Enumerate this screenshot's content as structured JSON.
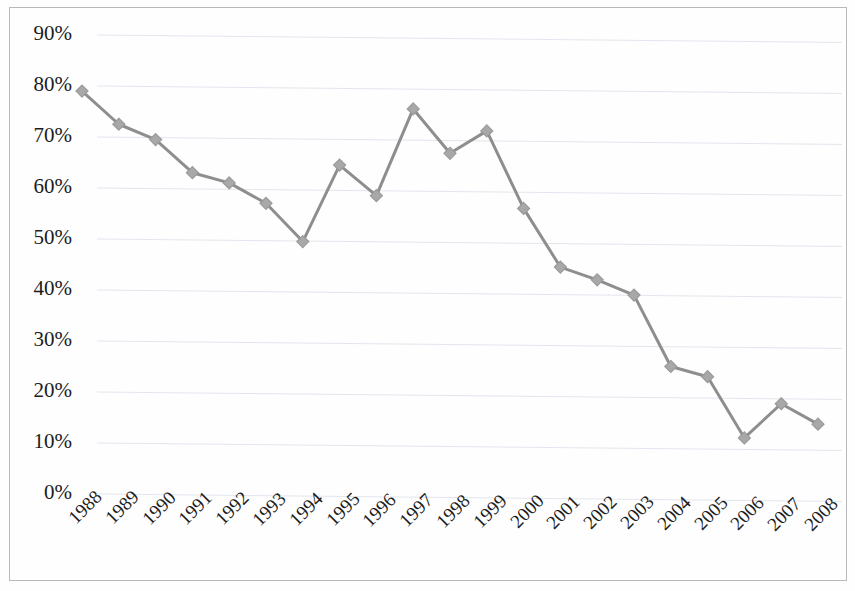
{
  "chart_data": {
    "type": "line",
    "title": "",
    "subtitle": "",
    "xlabel": "",
    "ylabel": "",
    "categories": [
      "1988",
      "1989",
      "1990",
      "1991",
      "1992",
      "1993",
      "1994",
      "1995",
      "1996",
      "1997",
      "1998",
      "1999",
      "2000",
      "2001",
      "2002",
      "2003",
      "2004",
      "2005",
      "2006",
      "2007",
      "2008"
    ],
    "values": [
      79,
      72.5,
      69.5,
      63,
      61,
      57,
      49.5,
      64.5,
      58.5,
      75.5,
      66.8,
      71.2,
      56,
      44.5,
      42,
      39,
      25,
      23,
      11,
      17.7,
      13.7
    ],
    "series": [
      {
        "name": "",
        "values": [
          79,
          72.5,
          69.5,
          63,
          61,
          57,
          49.5,
          64.5,
          58.5,
          75.5,
          66.8,
          71.2,
          56,
          44.5,
          42,
          39,
          25,
          23,
          11,
          17.7,
          13.7
        ]
      }
    ],
    "ylim": [
      0,
      90
    ],
    "ytick_values": [
      0,
      10,
      20,
      30,
      40,
      50,
      60,
      70,
      80,
      90
    ],
    "ytick_labels": [
      "0%",
      "10%",
      "20%",
      "30%",
      "40%",
      "50%",
      "60%",
      "70%",
      "80%",
      "90%"
    ],
    "xtick_labels": [
      "1988",
      "1989",
      "1990",
      "1991",
      "1992",
      "1993",
      "1994",
      "1995",
      "1996",
      "1997",
      "1998",
      "1999",
      "2000",
      "2001",
      "2002",
      "2003",
      "2004",
      "2005",
      "2006",
      "2007",
      "2008"
    ],
    "grid": "horizontal",
    "legend": "none",
    "marker": "diamond",
    "line_color": "#8e8e8e",
    "marker_color": "#a8a8a8",
    "grid_color": "#e3e6ee",
    "axis_text_color": "#1c1c1c",
    "border_color": "#b9b9b9",
    "x_tick_rotation": -45,
    "annotations": []
  }
}
